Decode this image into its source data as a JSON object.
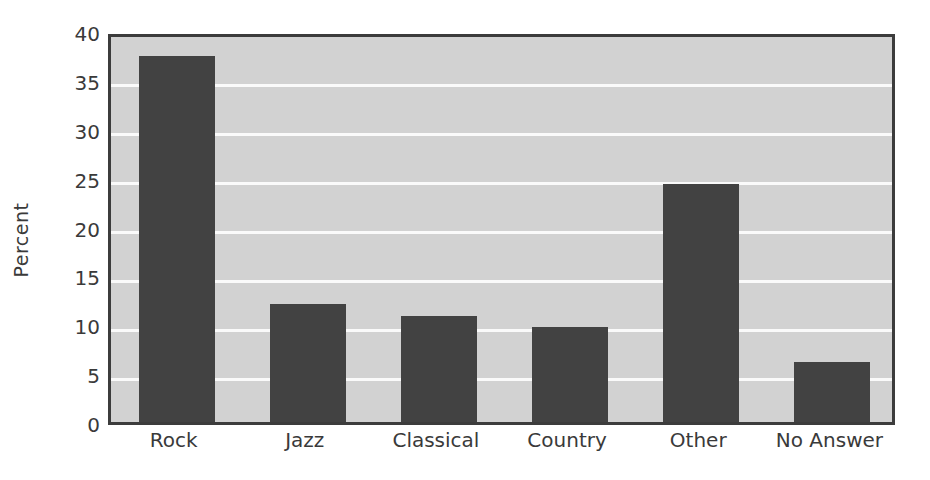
{
  "chart_data": {
    "type": "bar",
    "title": "",
    "subtitle": "",
    "xlabel": "",
    "ylabel": "Percent",
    "categories": [
      "Rock",
      "Jazz",
      "Classical",
      "Country",
      "Other",
      "No Answer"
    ],
    "values": [
      37.4,
      12.1,
      10.8,
      9.7,
      24.3,
      6.1
    ],
    "ylim": [
      0,
      40
    ],
    "ytick_labels": [
      "0",
      "5",
      "10",
      "15",
      "20",
      "25",
      "30",
      "35",
      "40"
    ],
    "ytick_values": [
      0,
      5,
      10,
      15,
      20,
      25,
      30,
      35,
      40
    ],
    "grid": true,
    "grid_color": "#fafafa",
    "legend": null,
    "legend_position": "none",
    "bar_color": "#424242",
    "plot_background": "#d2d2d2",
    "figure_background": "#ffffff",
    "axis_color": "#3c3c3c"
  }
}
